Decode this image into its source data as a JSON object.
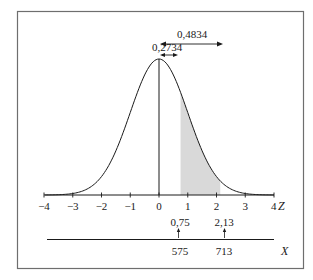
{
  "chart_data": {
    "type": "area",
    "title": "",
    "xlabel": "Z",
    "secondary_axis_label": "X",
    "xlim": [
      -4,
      4
    ],
    "x_ticks": [
      -4,
      -3,
      -2,
      -1,
      0,
      1,
      2,
      3,
      4
    ],
    "x_tick_labels": [
      "−4",
      "−3",
      "−2",
      "−1",
      "0",
      "1",
      "2",
      "3",
      "4"
    ],
    "curve": "standard normal density",
    "mean": 0,
    "sd": 1,
    "shaded_region": {
      "z_from": 0.75,
      "z_to": 2.13,
      "color": "#d9d9d9"
    },
    "annotations": [
      {
        "label": "0,4834",
        "type": "double-arrow",
        "z_from": 0,
        "z_to": 2.13
      },
      {
        "label": "0,2734",
        "type": "double-arrow",
        "z_from": 0,
        "z_to": 0.75
      }
    ],
    "z_markers": [
      {
        "z_label": "0,75",
        "x_label": "575",
        "z": 0.75
      },
      {
        "z_label": "2,13",
        "x_label": "713",
        "z": 2.13
      }
    ],
    "grid": false,
    "legend": "none"
  },
  "labels": {
    "area_total": "0,4834",
    "area_partial": "0,2734",
    "z_axis": "Z",
    "x_axis": "X",
    "z1": "0,75",
    "z2": "2,13",
    "x1": "575",
    "x2": "713",
    "ticks": [
      "−4",
      "−3",
      "−2",
      "−1",
      "0",
      "1",
      "2",
      "3",
      "4"
    ]
  },
  "colors": {
    "frame": "#6e6e6e",
    "line": "#1a1a1a",
    "shade": "#d9d9d9"
  }
}
